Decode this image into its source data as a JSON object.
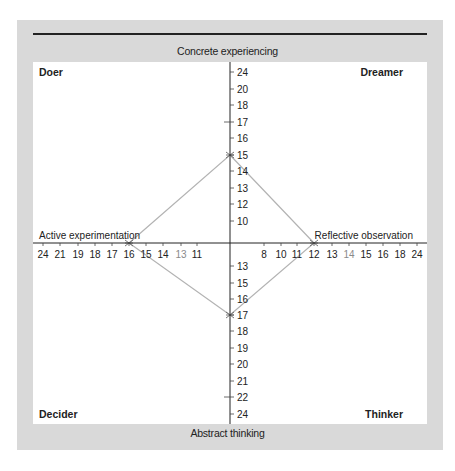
{
  "chart_data": {
    "type": "line",
    "title": "",
    "chart_kind": "learning-style quadrant diamond",
    "axes": {
      "top": "Concrete experiencing",
      "bottom": "Abstract thinking",
      "left": "Active experimentation",
      "right": "Reflective observation"
    },
    "quadrants": {
      "top_left": "Doer",
      "top_right": "Dreamer",
      "bottom_left": "Decider",
      "bottom_right": "Thinker"
    },
    "ticks": {
      "top": [
        "24",
        "20",
        "18",
        "17",
        "16",
        "15",
        "14",
        "13",
        "12",
        "10"
      ],
      "bottom": [
        "13",
        "15",
        "16",
        "17",
        "18",
        "19",
        "20",
        "21",
        "22",
        "24"
      ],
      "left": [
        "24",
        "21",
        "19",
        "18",
        "17",
        "16",
        "15",
        "14",
        "13",
        "11"
      ],
      "right": [
        "8",
        "10",
        "11",
        "12",
        "13",
        "14",
        "15",
        "16",
        "18",
        "24"
      ]
    },
    "series": [
      {
        "name": "Score profile",
        "points": [
          {
            "axis": "Concrete experiencing",
            "value": 15
          },
          {
            "axis": "Reflective observation",
            "value": 12
          },
          {
            "axis": "Abstract thinking",
            "value": 17
          },
          {
            "axis": "Active experimentation",
            "value": 16
          }
        ]
      }
    ],
    "grid": false,
    "legend": null
  },
  "colors": {
    "frame": "#d9d9d9",
    "panel": "#ffffff",
    "axis": "#222222",
    "diamond": "#b3b3b3",
    "muted_tick": "#8a8a8a"
  }
}
